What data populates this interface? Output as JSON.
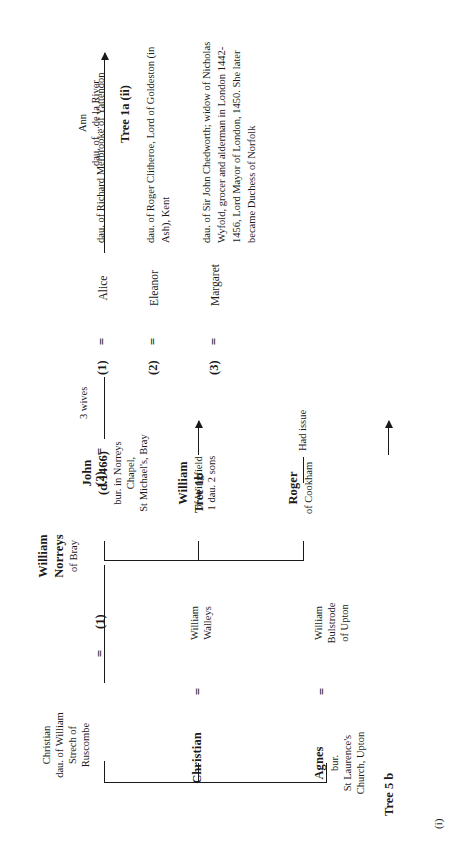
{
  "figure": {
    "caption": "(i)"
  },
  "people": {
    "agnes": {
      "name": "Agnes",
      "lines": [
        "bur.",
        "St Laurence's",
        "Church, Upton"
      ]
    },
    "bulstrode": {
      "lines": [
        "William",
        "Bulstrode",
        "of Upton"
      ]
    },
    "christian_walleys": {
      "name": "Christian",
      "lines": []
    },
    "walleys": {
      "lines": [
        "William",
        "Walleys"
      ]
    },
    "william_norreys": {
      "name_line1": "William",
      "name_line2": "Norreys",
      "sub": "of Bray"
    },
    "christian_strech": {
      "lines": [
        "Christian",
        "dau. of William",
        "Strech of",
        "Ruscombe"
      ]
    },
    "ann": {
      "lines": [
        "Ann",
        "dau. of ...de la River"
      ]
    },
    "john": {
      "name": "John",
      "name2": "(d.1466)",
      "lines": [
        "bur. in Norreys",
        "Chapel,",
        "St Michael's, Bray"
      ]
    },
    "william_wingfield": {
      "name": "William",
      "lines": [
        "of Wingfield",
        "1 dau. 2 sons"
      ]
    },
    "roger": {
      "name": "Roger",
      "sub": "of Cookham"
    }
  },
  "marriages": {
    "agnes_eq": "=",
    "christian_eq": "=",
    "first_marriage_number": "(1)",
    "first_marriage_eq": "=",
    "second_marriage_number": "(2)",
    "second_marriage_eq": "=",
    "john_wives_note": "3 wives",
    "wives": [
      {
        "number": "(1)",
        "eq": "=",
        "name": "Alice",
        "desc": "dau. of Richard Merbrooke of Yattendon"
      },
      {
        "number": "(2)",
        "eq": "=",
        "name": "Eleanor",
        "desc": "dau. of Roger Clitheroe, Lord of Goldeston (in\nAsh), Kent"
      },
      {
        "number": "(3)",
        "eq": "=",
        "name": "Margaret",
        "desc": "dau. of Sir John Chedworth; widow of Nicholas\nWyfold, grocer and alderman in London 1442-\n1456, Lord Mayor of London, 1450. She later\nbecame Duchess of Norfolk"
      }
    ]
  },
  "notes": {
    "had_issue": "Had issue"
  },
  "tree_refs": {
    "tree_5b": "Tree 5 b",
    "tree_1b": "Tree 1b",
    "tree_1a_ii": "Tree 1a (ii)"
  },
  "colors": {
    "ink": "#1a1a1a",
    "paper": "#ffffff"
  }
}
